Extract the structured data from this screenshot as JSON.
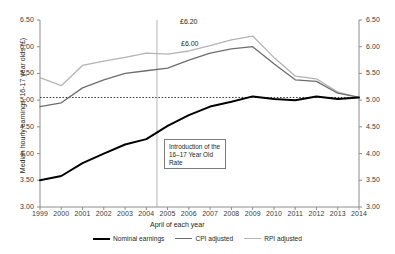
{
  "chart_data": {
    "type": "line",
    "title": "",
    "xlabel": "April of each year",
    "ylabel": "Median hourly earnings, 16-17 year olds (£)",
    "x": [
      1999,
      2000,
      2001,
      2002,
      2003,
      2004,
      2005,
      2006,
      2007,
      2008,
      2009,
      2010,
      2011,
      2012,
      2013,
      2014
    ],
    "xtick_labels": [
      "1999",
      "2000",
      "2001",
      "2002",
      "2003",
      "2004",
      "2005",
      "2006",
      "2007",
      "2008",
      "2009",
      "2010",
      "2011",
      "2012",
      "2013",
      "2014"
    ],
    "ylim": [
      3.0,
      6.5
    ],
    "ytick_labels": [
      "3.00",
      "3.50",
      "4.00",
      "4.50",
      "5.00",
      "5.50",
      "6.00",
      "6.50"
    ],
    "ytick_values": [
      3.0,
      3.5,
      4.0,
      4.5,
      5.0,
      5.5,
      6.0,
      6.5
    ],
    "right_axis": true,
    "right_ytick_labels": [
      "3.00",
      "3.50",
      "4.00",
      "4.50",
      "5.00",
      "5.50",
      "6.00",
      "6.50"
    ],
    "grid": false,
    "legend_position": "bottom",
    "series": [
      {
        "name": "Nominal earnings",
        "color": "#000000",
        "values": [
          3.5,
          3.58,
          3.82,
          4.0,
          4.17,
          4.27,
          4.52,
          4.72,
          4.88,
          4.97,
          5.07,
          5.02,
          5.0,
          5.07,
          5.02,
          5.05
        ]
      },
      {
        "name": "CPI adjusted",
        "color": "#6d6d6d",
        "values": [
          4.88,
          4.95,
          5.23,
          5.38,
          5.5,
          5.55,
          5.6,
          5.75,
          5.88,
          5.96,
          6.0,
          5.68,
          5.38,
          5.35,
          5.13,
          5.05
        ]
      },
      {
        "name": "RPI adjusted",
        "color": "#b4b4b4",
        "values": [
          5.42,
          5.27,
          5.65,
          5.73,
          5.8,
          5.88,
          5.86,
          5.92,
          6.02,
          6.13,
          6.2,
          5.8,
          5.45,
          5.4,
          5.15,
          5.05
        ]
      }
    ],
    "reference_line": {
      "name": "nominal-baseline",
      "type": "horizontal-dotted",
      "value": 5.05
    },
    "vertical_marker": {
      "name": "introduction-marker",
      "type": "vertical",
      "x": 2004.5
    },
    "annotations": [
      {
        "id": "intro-box",
        "text": "Introduction of the 16–17 Year Old Rate"
      },
      {
        "id": "rpi-peak",
        "text": "£6.20"
      },
      {
        "id": "cpi-peak",
        "text": "£6.00"
      }
    ]
  },
  "axes": {
    "y_title": "Median hourly earnings, 16-17 year olds (£)",
    "x_title": "April of each year"
  },
  "labels": {
    "rpi_peak": "£6.20",
    "cpi_peak": "£6.00",
    "annotation_line1": "Introduction of the",
    "annotation_line2": "16–17 Year Old",
    "annotation_line3": "Rate"
  },
  "legend": {
    "items": [
      {
        "label": "Nominal earnings"
      },
      {
        "label": "CPI adjusted"
      },
      {
        "label": "RPI adjusted"
      }
    ]
  }
}
